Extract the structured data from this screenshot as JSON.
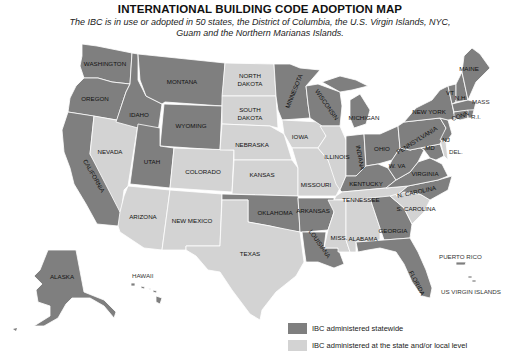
{
  "title": "INTERNATIONAL BUILDING CODE ADOPTION MAP",
  "subtitle": "The IBC is in use or adopted in 50 states, the District of Columbia, the U.S. Virgin Islands, NYC, Guam and the Northern Marianas Islands.",
  "colors": {
    "statewide": "#7f7f7f",
    "local": "#d3d3d3"
  },
  "legend": [
    {
      "key": "statewide",
      "label": "IBC administered statewide"
    },
    {
      "key": "local",
      "label": "IBC administered at the state and/or local level"
    }
  ],
  "states": {
    "washington": {
      "label": "WASHINGTON",
      "status": "statewide"
    },
    "oregon": {
      "label": "OREGON",
      "status": "statewide"
    },
    "california": {
      "label": "CALIFORNIA",
      "status": "statewide"
    },
    "idaho": {
      "label": "IDAHO",
      "status": "statewide"
    },
    "nevada": {
      "label": "NEVADA",
      "status": "local"
    },
    "montana": {
      "label": "MONTANA",
      "status": "statewide"
    },
    "wyoming": {
      "label": "WYOMING",
      "status": "statewide"
    },
    "utah": {
      "label": "UTAH",
      "status": "statewide"
    },
    "arizona": {
      "label": "ARIZONA",
      "status": "local"
    },
    "colorado": {
      "label": "COLORADO",
      "status": "local"
    },
    "new_mexico": {
      "label": "NEW MEXICO",
      "status": "local"
    },
    "north_dakota": {
      "label1": "NORTH",
      "label2": "DAKOTA",
      "status": "local"
    },
    "south_dakota": {
      "label1": "SOUTH",
      "label2": "DAKOTA",
      "status": "local"
    },
    "nebraska": {
      "label": "NEBRASKA",
      "status": "local"
    },
    "kansas": {
      "label": "KANSAS",
      "status": "local"
    },
    "oklahoma": {
      "label": "OKLAHOMA",
      "status": "statewide"
    },
    "texas": {
      "label": "TEXAS",
      "status": "local"
    },
    "minnesota": {
      "label": "MINNESOTA",
      "status": "statewide"
    },
    "iowa": {
      "label": "IOWA",
      "status": "local"
    },
    "missouri": {
      "label": "MISSOURI",
      "status": "local"
    },
    "arkansas": {
      "label": "ARKANSAS",
      "status": "statewide"
    },
    "louisiana": {
      "label": "LOUISIANA",
      "status": "statewide"
    },
    "wisconsin": {
      "label": "WISCONSIN",
      "status": "statewide"
    },
    "illinois": {
      "label": "ILLINOIS",
      "status": "local"
    },
    "michigan": {
      "label": "MICHIGAN",
      "status": "statewide"
    },
    "indiana": {
      "label": "INDIANA",
      "status": "statewide"
    },
    "ohio": {
      "label": "OHIO",
      "status": "statewide"
    },
    "kentucky": {
      "label": "KENTUCKY",
      "status": "statewide"
    },
    "tennessee": {
      "label": "TENNESSEE",
      "status": "local"
    },
    "mississippi": {
      "label": "MISS.",
      "status": "local"
    },
    "alabama": {
      "label": "ALABAMA",
      "status": "local"
    },
    "georgia": {
      "label": "GEORGIA",
      "status": "statewide"
    },
    "florida": {
      "label": "FLORIDA",
      "status": "statewide"
    },
    "south_carolina": {
      "label": "S. CAROLINA",
      "status": "local"
    },
    "north_carolina": {
      "label": "N. CAROLINA",
      "status": "statewide"
    },
    "virginia": {
      "label": "VIRGINIA",
      "status": "statewide"
    },
    "west_virginia": {
      "label": "W. VA",
      "status": "statewide"
    },
    "maryland": {
      "label": "MD",
      "status": "statewide"
    },
    "delaware": {
      "label": "DEL.",
      "status": "local"
    },
    "pennsylvania": {
      "label": "PENNSYLVANIA",
      "status": "statewide"
    },
    "new_jersey": {
      "label": "NJ",
      "status": "statewide"
    },
    "new_york": {
      "label": "NEW YORK",
      "status": "statewide"
    },
    "connecticut": {
      "label": "CONN",
      "status": "statewide"
    },
    "rhode_island": {
      "label": "R.I.",
      "status": "statewide"
    },
    "massachusetts": {
      "label": "MASS",
      "status": "statewide"
    },
    "vermont": {
      "label": "VT",
      "status": "statewide"
    },
    "new_hampshire": {
      "label": "N.H.",
      "status": "statewide"
    },
    "maine": {
      "label": "MAINE",
      "status": "statewide"
    },
    "alaska": {
      "label": "ALASKA",
      "status": "statewide"
    },
    "hawaii": {
      "label": "HAWAII",
      "status": "statewide"
    },
    "puerto_rico": {
      "label": "PUERTO RICO",
      "status": "statewide"
    },
    "us_virgin_islands": {
      "label": "US VIRGIN ISLANDS",
      "status": "statewide"
    }
  }
}
